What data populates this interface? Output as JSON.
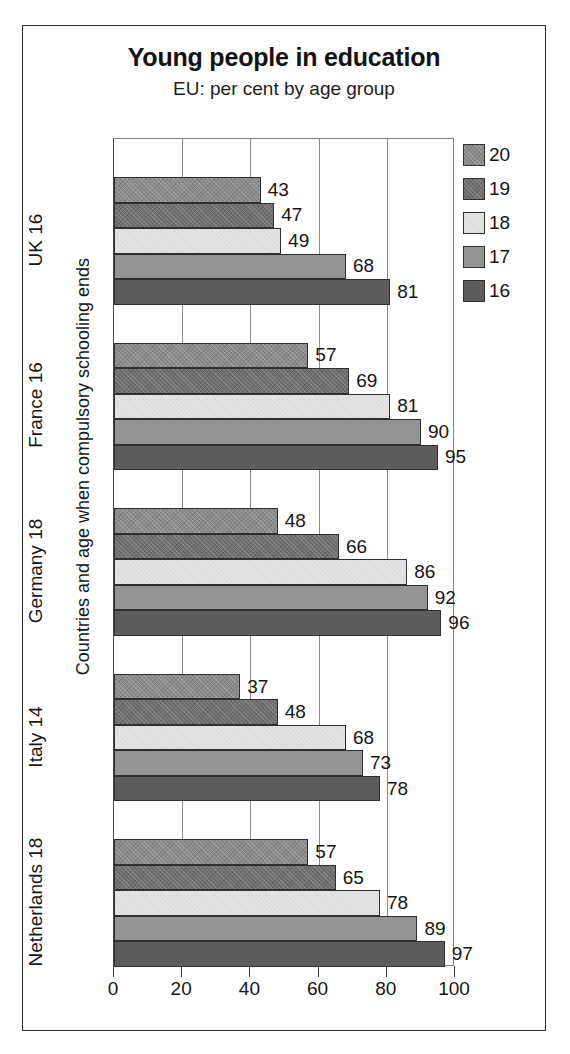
{
  "chart_data": {
    "type": "bar",
    "orientation": "horizontal",
    "title": "Young people in education",
    "subtitle": "EU: per cent by age group",
    "xlabel": "",
    "ylabel": "Countries and age when compulsory schooling ends",
    "xlim": [
      0,
      100
    ],
    "xticks": [
      0,
      20,
      40,
      60,
      80,
      100
    ],
    "grid": true,
    "legend_position": "right",
    "legend_title": "",
    "categories": [
      "UK 16",
      "France 16",
      "Germany 18",
      "Italy 14",
      "Netherlands 18"
    ],
    "series": [
      {
        "name": "20",
        "color": "#8b8b8b",
        "values": [
          43,
          57,
          48,
          37,
          57
        ]
      },
      {
        "name": "19",
        "color": "#6f6f6f",
        "values": [
          47,
          69,
          66,
          48,
          65
        ]
      },
      {
        "name": "18",
        "color": "#e3e3e3",
        "values": [
          49,
          81,
          86,
          68,
          78
        ]
      },
      {
        "name": "17",
        "color": "#949494",
        "values": [
          68,
          90,
          92,
          73,
          89
        ]
      },
      {
        "name": "16",
        "color": "#5d5d5d",
        "values": [
          81,
          95,
          96,
          78,
          97
        ]
      }
    ]
  },
  "axis": {
    "tick_labels": [
      "0",
      "20",
      "40",
      "60",
      "80",
      "100"
    ]
  },
  "legend": {
    "items": [
      {
        "label": "20",
        "shade": "sh-20"
      },
      {
        "label": "19",
        "shade": "sh-19"
      },
      {
        "label": "18",
        "shade": "sh-18"
      },
      {
        "label": "17",
        "shade": "sh-17"
      },
      {
        "label": "16",
        "shade": "sh-16"
      }
    ]
  }
}
